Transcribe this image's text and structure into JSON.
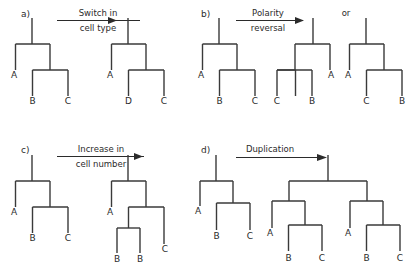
{
  "figure": {
    "background_color": "#ffffff",
    "line_color": "#3a3a3a",
    "text_color": "#2b2b2b",
    "width": 416,
    "height": 273
  },
  "panels": [
    {
      "id": "a",
      "label": "a)",
      "arrow": {
        "line1": "Switch in",
        "line2": "cell type",
        "has_rule": true
      },
      "trees": [
        {
          "name": "before",
          "leaves": [
            "A",
            "B",
            "C"
          ],
          "orientation": "normal"
        },
        {
          "name": "after",
          "leaves": [
            "A",
            "D",
            "C"
          ],
          "orientation": "normal"
        }
      ]
    },
    {
      "id": "b",
      "label": "b)",
      "arrow": {
        "line1": "Polarity",
        "line2": "reversal",
        "has_rule": true
      },
      "connector": "or",
      "trees": [
        {
          "name": "before",
          "leaves": [
            "A",
            "B",
            "C"
          ],
          "orientation": "normal"
        },
        {
          "name": "after-mirrored",
          "leaves": [
            "C",
            "B",
            "A"
          ],
          "orientation": "mirrored"
        },
        {
          "name": "after-relabeled",
          "leaves": [
            "A",
            "C",
            "B"
          ],
          "orientation": "normal"
        }
      ]
    },
    {
      "id": "c",
      "label": "c)",
      "arrow": {
        "line1": "Increase in",
        "line2": "cell number",
        "has_rule": true
      },
      "trees": [
        {
          "name": "before",
          "leaves": [
            "A",
            "B",
            "C"
          ],
          "orientation": "normal"
        },
        {
          "name": "after",
          "leaves": [
            "A",
            "B",
            "B",
            "C"
          ],
          "orientation": "normal"
        }
      ]
    },
    {
      "id": "d",
      "label": "d)",
      "arrow": {
        "line1": "Duplication",
        "line2": "",
        "has_rule": false
      },
      "trees": [
        {
          "name": "before",
          "leaves": [
            "A",
            "B",
            "C"
          ],
          "orientation": "normal"
        },
        {
          "name": "after-copy-1",
          "leaves": [
            "A",
            "B",
            "C"
          ],
          "orientation": "normal"
        },
        {
          "name": "after-copy-2",
          "leaves": [
            "A",
            "B",
            "C"
          ],
          "orientation": "normal"
        }
      ]
    }
  ],
  "labels": {
    "panel_a": "a)",
    "panel_b": "b)",
    "panel_c": "c)",
    "panel_d": "d)",
    "or": "or",
    "arrow_a_1": "Switch in",
    "arrow_a_2": "cell type",
    "arrow_b_1": "Polarity",
    "arrow_b_2": "reversal",
    "arrow_c_1": "Increase in",
    "arrow_c_2": "cell number",
    "arrow_d_1": "Duplication",
    "a_t1_l1": "A",
    "a_t1_l2": "B",
    "a_t1_l3": "C",
    "a_t2_l1": "A",
    "a_t2_l2": "D",
    "a_t2_l3": "C",
    "b_t1_l1": "A",
    "b_t1_l2": "B",
    "b_t1_l3": "C",
    "b_t2_l1": "C",
    "b_t2_l2": "B",
    "b_t2_l3": "A",
    "b_t3_l1": "A",
    "b_t3_l2": "C",
    "b_t3_l3": "B",
    "c_t1_l1": "A",
    "c_t1_l2": "B",
    "c_t1_l3": "C",
    "c_t2_l1": "A",
    "c_t2_l2": "B",
    "c_t2_l3": "B",
    "c_t2_l4": "C",
    "d_t1_l1": "A",
    "d_t1_l2": "B",
    "d_t1_l3": "C",
    "d_t2_l1": "A",
    "d_t2_l2": "B",
    "d_t2_l3": "C",
    "d_t3_l1": "A",
    "d_t3_l2": "B",
    "d_t3_l3": "C"
  }
}
